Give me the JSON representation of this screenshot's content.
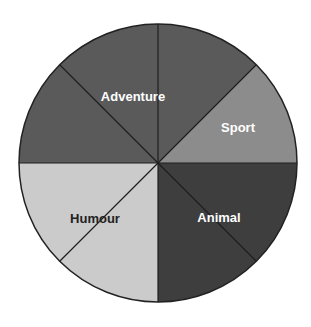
{
  "chart_data": {
    "type": "pie",
    "title": "",
    "total_parts": 8,
    "slices": [
      {
        "label": "Adventure",
        "value": 3,
        "fraction": 0.375,
        "color": "#5a5a5a",
        "text_color": "#ffffff"
      },
      {
        "label": "Sport",
        "value": 1,
        "fraction": 0.125,
        "color": "#8c8c8c",
        "text_color": "#ffffff"
      },
      {
        "label": "Animal",
        "value": 2,
        "fraction": 0.25,
        "color": "#3e3e3e",
        "text_color": "#ffffff"
      },
      {
        "label": "Humour",
        "value": 2,
        "fraction": 0.25,
        "color": "#cbcbcb",
        "text_color": "#222222"
      }
    ],
    "divisions": "8 equal sectors marked with lines",
    "legend": "none (labels inside slices)"
  }
}
